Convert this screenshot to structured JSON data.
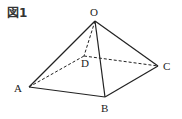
{
  "figure": {
    "label": "図1",
    "colors": {
      "line": "#222222",
      "background": "#ffffff"
    },
    "vertices": [
      {
        "name": "O",
        "label": "O",
        "x": 95,
        "y": 21,
        "lx": 90,
        "ly": 16
      },
      {
        "name": "A",
        "label": "A",
        "x": 29,
        "y": 87,
        "lx": 14,
        "ly": 92
      },
      {
        "name": "B",
        "label": "B",
        "x": 105,
        "y": 97,
        "lx": 101,
        "ly": 112
      },
      {
        "name": "C",
        "label": "C",
        "x": 158,
        "y": 66,
        "lx": 163,
        "ly": 70
      },
      {
        "name": "D",
        "label": "D",
        "x": 84,
        "y": 56,
        "lx": 81,
        "ly": 67
      }
    ],
    "edges": [
      {
        "from": "O",
        "to": "A",
        "style": "solid"
      },
      {
        "from": "O",
        "to": "B",
        "style": "solid"
      },
      {
        "from": "O",
        "to": "C",
        "style": "solid"
      },
      {
        "from": "A",
        "to": "B",
        "style": "solid"
      },
      {
        "from": "B",
        "to": "C",
        "style": "solid"
      },
      {
        "from": "O",
        "to": "D",
        "style": "dashed"
      },
      {
        "from": "A",
        "to": "D",
        "style": "dashed"
      },
      {
        "from": "D",
        "to": "C",
        "style": "dashed"
      }
    ]
  }
}
